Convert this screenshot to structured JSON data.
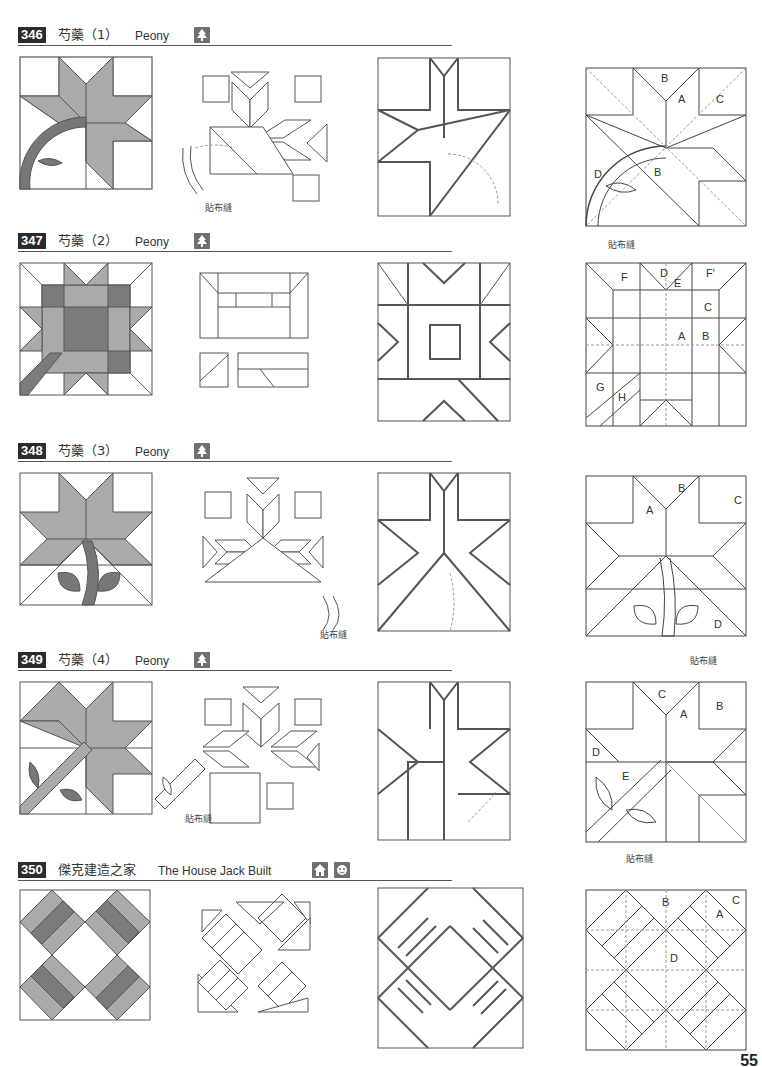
{
  "page": {
    "number": "55"
  },
  "colors": {
    "fabric_light": "#a9a9a9",
    "fabric_dark": "#7b7b7b",
    "line": "#444444",
    "guide": "#999999",
    "badge_bg": "#2b2b2b",
    "icon_bg": "#6f6f6f"
  },
  "blocks": [
    {
      "number": "346",
      "title_cn": "芍藥（1）",
      "title_en": "Peony",
      "icons": [
        "tree-icon"
      ],
      "applique_label": "貼布縫",
      "piece_labels": [
        "A",
        "B",
        "B",
        "C",
        "D"
      ]
    },
    {
      "number": "347",
      "title_cn": "芍藥（2）",
      "title_en": "Peony",
      "icons": [
        "tree-icon"
      ],
      "piece_labels": [
        "A",
        "B",
        "C",
        "D",
        "E",
        "F",
        "F'",
        "G",
        "H"
      ]
    },
    {
      "number": "348",
      "title_cn": "芍藥（3）",
      "title_en": "Peony",
      "icons": [
        "tree-icon"
      ],
      "applique_label": "貼布縫",
      "piece_labels": [
        "A",
        "B",
        "C",
        "D"
      ]
    },
    {
      "number": "349",
      "title_cn": "芍藥（4）",
      "title_en": "Peony",
      "icons": [
        "tree-icon"
      ],
      "applique_label": "貼布縫",
      "piece_labels": [
        "A",
        "B",
        "C",
        "D",
        "E"
      ]
    },
    {
      "number": "350",
      "title_cn": "傑克建造之家",
      "title_en": "The House Jack Built",
      "icons": [
        "house-icon",
        "face-icon"
      ],
      "piece_labels": [
        "A",
        "B",
        "C",
        "D"
      ]
    }
  ]
}
